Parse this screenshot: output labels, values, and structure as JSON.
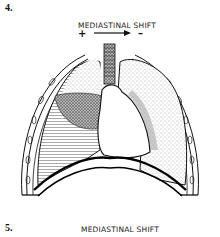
{
  "figure_4": {
    "number": "4.",
    "caption": "MEDIASTINAL SHIFT",
    "plus_sign": "+",
    "minus_sign": "–",
    "arrow_direction": "right",
    "illustration": "chest-cross-section-pleural-effusion"
  },
  "figure_5": {
    "number": "5.",
    "caption": "MEDIASTINAL SHIFT"
  }
}
